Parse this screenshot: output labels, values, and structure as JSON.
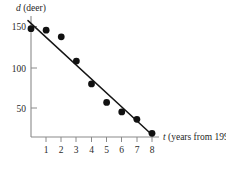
{
  "figure": {
    "name": "deer-population-scatter",
    "background_color": "#ffffff",
    "ink_color": "#111111",
    "axis_color": "#8a8a8a"
  },
  "axes": {
    "y": {
      "variable": "d",
      "unit_label": "(deer)",
      "full_label": "d (deer)",
      "ticks": [
        50,
        100,
        150
      ],
      "tick_labels": [
        "50",
        "100",
        "150"
      ]
    },
    "x": {
      "variable": "t",
      "unit_label": "(years from 1992)",
      "full_label": "t (years from 1992)",
      "ticks": [
        1,
        2,
        3,
        4,
        5,
        6,
        7,
        8
      ],
      "tick_labels": [
        "1",
        "2",
        "3",
        "4",
        "5",
        "6",
        "7",
        "8"
      ]
    }
  },
  "chart_data": {
    "type": "scatter",
    "title": "",
    "subtitle": "",
    "xlabel": "t (years from 1992)",
    "ylabel": "d (deer)",
    "xlim": [
      0,
      8.6
    ],
    "ylim": [
      0,
      160
    ],
    "xticks": [
      1,
      2,
      3,
      4,
      5,
      6,
      7,
      8
    ],
    "yticks": [
      50,
      100,
      150
    ],
    "grid": false,
    "legend": false,
    "legend_position": "none",
    "series": [
      {
        "name": "Deer population observations",
        "type": "scatter",
        "marker": "filled-circle",
        "color": "#111111",
        "x": [
          0,
          1,
          2,
          3,
          4,
          5,
          6,
          7,
          8
        ],
        "y": [
          147,
          145,
          136,
          103,
          72,
          47,
          34,
          24,
          5
        ]
      },
      {
        "name": "Line of best fit",
        "type": "line",
        "color": "#151515",
        "x": [
          -0.2,
          8.05
        ],
        "y": [
          158,
          2
        ]
      }
    ],
    "annotations": []
  }
}
